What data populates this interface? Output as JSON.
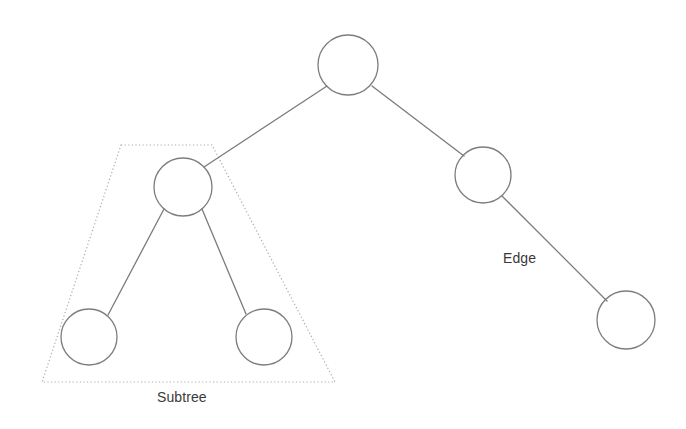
{
  "diagram": {
    "type": "binary-tree",
    "background_color": "#ffffff",
    "node_stroke_color": "#7d7d7d",
    "edge_stroke_color": "#7b7b7b",
    "outline_stroke_color": "#aaaaaa",
    "label_color": "#3a3a3a",
    "nodes": [
      {
        "id": "root",
        "label": "",
        "cx": 348,
        "cy": 65,
        "rx": 30,
        "ry": 30
      },
      {
        "id": "left-child",
        "label": "",
        "cx": 183,
        "cy": 187,
        "rx": 29,
        "ry": 29
      },
      {
        "id": "right-child",
        "label": "",
        "cx": 483,
        "cy": 175,
        "rx": 28,
        "ry": 28
      },
      {
        "id": "leaf-left",
        "label": "",
        "cx": 89,
        "cy": 337,
        "rx": 28,
        "ry": 28
      },
      {
        "id": "leaf-right",
        "label": "",
        "cx": 264,
        "cy": 337,
        "rx": 28,
        "ry": 28
      },
      {
        "id": "leaf-far-right",
        "label": "",
        "cx": 626,
        "cy": 320,
        "rx": 29,
        "ry": 29
      }
    ],
    "edges": [
      {
        "id": "root-to-left-child",
        "from": "root",
        "to": "left-child",
        "x1": 327,
        "y1": 86,
        "x2": 204,
        "y2": 167
      },
      {
        "id": "root-to-right-child",
        "from": "root",
        "to": "right-child",
        "x1": 372,
        "y1": 86,
        "x2": 464,
        "y2": 156
      },
      {
        "id": "left-child-to-leaf-left",
        "from": "left-child",
        "to": "leaf-left",
        "x1": 164,
        "y1": 209,
        "x2": 108,
        "y2": 315
      },
      {
        "id": "left-child-to-leaf-right",
        "from": "left-child",
        "to": "leaf-right",
        "x1": 202,
        "y1": 209,
        "x2": 246,
        "y2": 314
      },
      {
        "id": "right-child-to-leaf-far-right",
        "from": "right-child",
        "to": "leaf-far-right",
        "x1": 502,
        "y1": 196,
        "x2": 607,
        "y2": 301
      }
    ],
    "subtree_outline": {
      "id": "subtree-boundary",
      "points": "121,145 212,145 335,382 42,382",
      "style": "dotted"
    },
    "labels": [
      {
        "id": "edge-label",
        "text": "Edge",
        "x": 503,
        "y": 250
      },
      {
        "id": "subtree-label",
        "text": "Subtree",
        "x": 157,
        "y": 389
      }
    ]
  }
}
